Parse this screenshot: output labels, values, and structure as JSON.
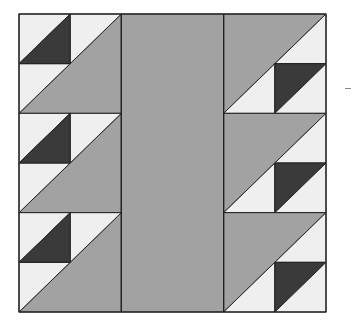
{
  "diagram": {
    "title": "",
    "type": "quilt-block",
    "grid": {
      "columns": 6,
      "rows": 6
    },
    "colors": {
      "light": "#efefef",
      "medium": "#a2a2a2",
      "dark": "#3a3a3a",
      "line": "#222222",
      "background": "#ffffff"
    },
    "panels": [
      {
        "name": "left-panel",
        "units": "2x6",
        "motif": "half-square triangles with large gray triangles, dark triangle upper-left",
        "groups": 3
      },
      {
        "name": "center-panel",
        "units": "2x6",
        "motif": "solid medium gray strip"
      },
      {
        "name": "right-panel",
        "units": "2x6",
        "motif": "rotated 180°, dark triangle lower-right",
        "groups": 3
      }
    ]
  }
}
